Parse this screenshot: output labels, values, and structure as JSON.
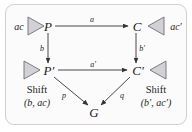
{
  "figure": {
    "type": "commutative-diagram",
    "panel": {
      "background_color": "#fbfbfc",
      "border_color": "#cfcfd4"
    },
    "nodes": {
      "p": "P",
      "c": "C",
      "p_prime": "P′",
      "c_prime": "C′",
      "g": "G"
    },
    "edges": {
      "p_to_c": "a",
      "p_to_pprime": "b",
      "c_to_cprime": "b′",
      "pprime_to_cprime": "a′",
      "pprime_to_g": "p",
      "cprime_to_g": "q"
    },
    "side_labels": {
      "top_left": "ac",
      "top_right": "ac′"
    },
    "shift_left": {
      "word": "Shift",
      "args": "(b, ac)"
    },
    "shift_right": {
      "word": "Shift",
      "args": "(b′, ac′)"
    },
    "triangles": {
      "top_left": "triangle-right-icon",
      "top_right": "triangle-left-icon",
      "bottom_left": "triangle-right-icon",
      "bottom_right": "triangle-left-icon"
    },
    "colors": {
      "triangle_fill": "#d2d2d6",
      "triangle_stroke": "#6e6e74",
      "line": "#333338",
      "text": "#1b1b1b"
    }
  }
}
